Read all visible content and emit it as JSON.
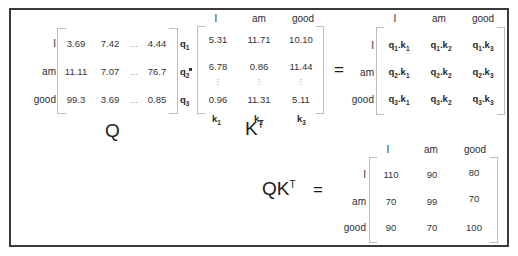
{
  "figure": {
    "background_color": "#ffffff",
    "border_color": "#3a3a3a",
    "bracket_color": "#bdbdbd",
    "text_color": "#2b2b2b"
  },
  "tokens": [
    "I",
    "am",
    "good"
  ],
  "operators": {
    "dot": "·",
    "equals": "=",
    "vdots": "⋮",
    "hdots": "..."
  },
  "labels": {
    "q_matrix": "Q",
    "k_matrix": "K",
    "k_matrix_sup": "T",
    "product": "QK",
    "product_sup": "T",
    "product_equals": "="
  },
  "q_matrix": {
    "name": "Q",
    "row_labels": [
      "I",
      "am",
      "good"
    ],
    "row_vector_labels": [
      {
        "base": "q",
        "sub": "1"
      },
      {
        "base": "q",
        "sub": "2"
      },
      {
        "base": "q",
        "sub": "3"
      }
    ],
    "rows": [
      [
        "3.69",
        "7.42",
        "...",
        "4.44"
      ],
      [
        "11.11",
        "7.07",
        "...",
        "76.7"
      ],
      [
        "99.3",
        "3.69",
        "...",
        "0.85"
      ]
    ]
  },
  "k_transpose_matrix": {
    "name": "K^T",
    "col_labels": [
      "I",
      "am",
      "good"
    ],
    "col_vector_labels": [
      {
        "base": "k",
        "sub": "1"
      },
      {
        "base": "k",
        "sub": "2"
      },
      {
        "base": "k",
        "sub": "3"
      }
    ],
    "rows": [
      [
        "5.31",
        "11.71",
        "10.10"
      ],
      [
        "6.78",
        "0.86",
        "11.44"
      ],
      [
        "⋮",
        "⋮",
        "⋮"
      ],
      [
        "0.96",
        "11.31",
        "5.11"
      ]
    ]
  },
  "dot_product_matrix": {
    "name": "q-dot-k symbolic matrix",
    "col_labels": [
      "I",
      "am",
      "good"
    ],
    "row_labels": [
      "I",
      "am",
      "good"
    ],
    "rows": [
      [
        {
          "q": "1",
          "k": "1"
        },
        {
          "q": "1",
          "k": "2"
        },
        {
          "q": "1",
          "k": "3"
        }
      ],
      [
        {
          "q": "2",
          "k": "1"
        },
        {
          "q": "2",
          "k": "2"
        },
        {
          "q": "2",
          "k": "3"
        }
      ],
      [
        {
          "q": "3",
          "k": "1"
        },
        {
          "q": "3",
          "k": "2"
        },
        {
          "q": "3",
          "k": "3"
        }
      ]
    ]
  },
  "result_matrix": {
    "name": "QK^T result",
    "col_labels": [
      "I",
      "am",
      "good"
    ],
    "row_labels": [
      "I",
      "am",
      "good"
    ],
    "rows": [
      [
        "110",
        "90",
        "80"
      ],
      [
        "70",
        "99",
        "70"
      ],
      [
        "90",
        "70",
        "100"
      ]
    ]
  }
}
